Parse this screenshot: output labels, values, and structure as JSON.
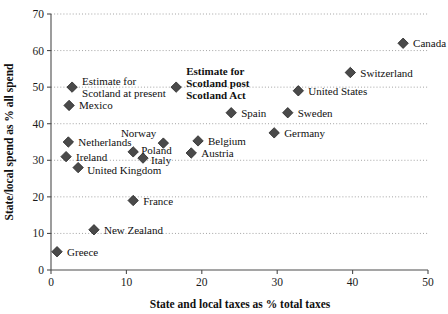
{
  "chart_data": {
    "type": "scatter",
    "title": "",
    "xlabel": "State and local taxes as % total taxes",
    "ylabel": "State/local spend as % all spend",
    "xlim": [
      0,
      50
    ],
    "ylim": [
      0,
      70
    ],
    "xticks": [
      "0",
      "10",
      "20",
      "30",
      "40",
      "50"
    ],
    "xtick_values": [
      0,
      10,
      20,
      30,
      40,
      50
    ],
    "yticks": [
      "0",
      "10",
      "20",
      "30",
      "40",
      "50",
      "60",
      "70"
    ],
    "ytick_values": [
      0,
      10,
      20,
      30,
      40,
      50,
      60,
      70
    ],
    "grid": "horizontal-dotted",
    "legend": "none",
    "marker_shape": "diamond",
    "points": [
      {
        "label": "Canada",
        "x": 46.7,
        "y": 62,
        "lx": 10,
        "ly": 4,
        "anchor": "start",
        "bold": false
      },
      {
        "label": "Switzerland",
        "x": 39.7,
        "y": 54,
        "lx": 10,
        "ly": 4,
        "anchor": "start",
        "bold": false
      },
      {
        "label": "Estimate for\nScotland at present",
        "x": 2.8,
        "y": 50,
        "lx": 10,
        "ly": -2,
        "anchor": "start",
        "bold": false
      },
      {
        "label": "Estimate for\nScotland post\nScotland Act",
        "x": 16.6,
        "y": 50,
        "lx": 10,
        "ly": -12,
        "anchor": "start",
        "bold": true
      },
      {
        "label": "United States",
        "x": 32.8,
        "y": 49,
        "lx": 10,
        "ly": 4,
        "anchor": "start",
        "bold": false
      },
      {
        "label": "Mexico",
        "x": 2.4,
        "y": 45,
        "lx": 10,
        "ly": 4,
        "anchor": "start",
        "bold": false
      },
      {
        "label": "Spain",
        "x": 23.9,
        "y": 43,
        "lx": 10,
        "ly": 4,
        "anchor": "start",
        "bold": false
      },
      {
        "label": "Sweden",
        "x": 31.4,
        "y": 43,
        "lx": 10,
        "ly": 4,
        "anchor": "start",
        "bold": false
      },
      {
        "label": "Germany",
        "x": 29.6,
        "y": 37.5,
        "lx": 10,
        "ly": 4,
        "anchor": "start",
        "bold": false
      },
      {
        "label": "Belgium",
        "x": 19.5,
        "y": 35.3,
        "lx": 10,
        "ly": 4,
        "anchor": "start",
        "bold": false
      },
      {
        "label": "Netherlands",
        "x": 2.3,
        "y": 35,
        "lx": 10,
        "ly": 4,
        "anchor": "start",
        "bold": false
      },
      {
        "label": "Norway",
        "x": 14.9,
        "y": 34.7,
        "lx": -7,
        "ly": -6,
        "anchor": "end",
        "bold": false
      },
      {
        "label": "Austria",
        "x": 18.6,
        "y": 32,
        "lx": 10,
        "ly": 4,
        "anchor": "start",
        "bold": false
      },
      {
        "label": "Poland",
        "x": 10.9,
        "y": 32.3,
        "lx": 8,
        "ly": 2,
        "anchor": "start",
        "bold": false
      },
      {
        "label": "Ireland",
        "x": 2.0,
        "y": 31,
        "lx": 10,
        "ly": 4,
        "anchor": "start",
        "bold": false
      },
      {
        "label": "Italy",
        "x": 12.2,
        "y": 30.6,
        "lx": 8,
        "ly": 6,
        "anchor": "start",
        "bold": false
      },
      {
        "label": "United Kingdom",
        "x": 3.6,
        "y": 28,
        "lx": 9,
        "ly": 6,
        "anchor": "start",
        "bold": false
      },
      {
        "label": "France",
        "x": 10.9,
        "y": 19,
        "lx": 10,
        "ly": 4,
        "anchor": "start",
        "bold": false
      },
      {
        "label": "New Zealand",
        "x": 5.7,
        "y": 11,
        "lx": 10,
        "ly": 4,
        "anchor": "start",
        "bold": false
      },
      {
        "label": "Greece",
        "x": 0.8,
        "y": 5,
        "lx": 10,
        "ly": 4,
        "anchor": "start",
        "bold": false
      }
    ]
  },
  "colors": {
    "marker": "#4a4a4a",
    "marker_edge": "#262626",
    "axis": "#4c4c4c",
    "grid": "#9a9a9a",
    "text": "#101010",
    "background": "#ffffff"
  }
}
